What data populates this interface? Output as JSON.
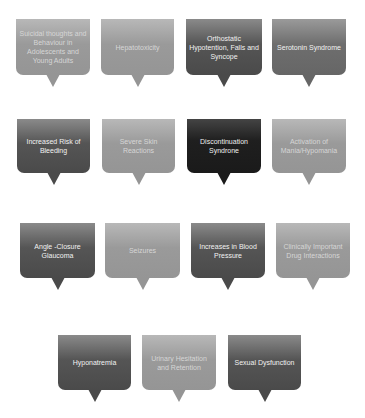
{
  "diagram": {
    "type": "speech-bubble-grid",
    "items": [
      {
        "label": "Suicidal thoughts and Behaviour in Adolescents and Young Adults",
        "shade": "light"
      },
      {
        "label": "Hepatotoxicity",
        "shade": "light"
      },
      {
        "label": "Orthostatic Hypotention, Falls and Syncope",
        "shade": "dark"
      },
      {
        "label": "Serotonin Syndrome",
        "shade": "mid"
      },
      {
        "label": "Increased Risk of Bleeding",
        "shade": "dark"
      },
      {
        "label": "Severe Skin Reactions",
        "shade": "light"
      },
      {
        "label": "Discontinuation Syndrone",
        "shade": "black"
      },
      {
        "label": "Activation of Mania/Hypomania",
        "shade": "light"
      },
      {
        "label": "Angle -Closure Glaucoma",
        "shade": "dark"
      },
      {
        "label": "Seizures",
        "shade": "light"
      },
      {
        "label": "Increases in Blood Pressure",
        "shade": "dark"
      },
      {
        "label": "Clinically Important Drug Interactions",
        "shade": "light"
      },
      {
        "label": "Hyponatremia",
        "shade": "dark"
      },
      {
        "label": "Urinary Hesitation and Retention",
        "shade": "light"
      },
      {
        "label": "Sexual Dysfunction",
        "shade": "dark"
      }
    ],
    "colors": {
      "black": "#1f1f1f",
      "dark": "#555555",
      "mid": "#6e6e6e",
      "light": "#9a9a9a",
      "background": "#ffffff"
    }
  }
}
